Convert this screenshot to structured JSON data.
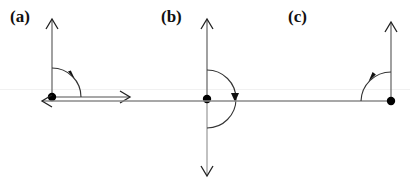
{
  "panels": [
    {
      "id": "a",
      "label": "(a)",
      "description": "Vertical arrow up and horizontal arrow right from a dot, clockwise quarter-arc from up to right"
    },
    {
      "id": "b",
      "label": "(b)",
      "description": "Vertical arrow up and vertical arrow down from a dot, clockwise semicircular arc from up to down"
    },
    {
      "id": "c",
      "label": "(c)",
      "description": "Vertical arrow up and horizontal arrow left from a dot, counter-clockwise quarter-arc from up to left"
    }
  ],
  "colors": {
    "stroke": "#8a8a8a",
    "arc": "#222222",
    "dot": "#000000",
    "background": "#ffffff"
  }
}
